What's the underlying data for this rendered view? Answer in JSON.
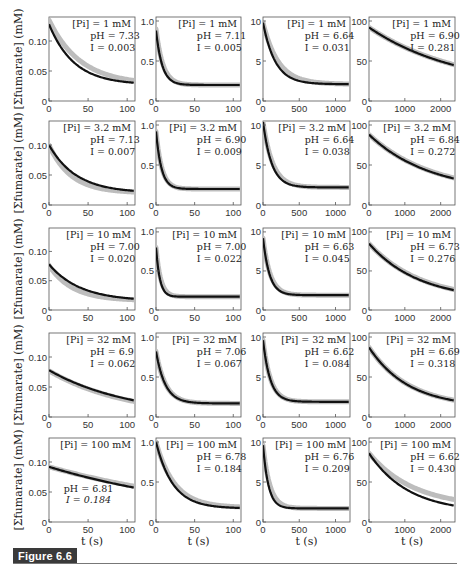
{
  "figure_label": "Figure 6.6",
  "chart_data": {
    "type": "line",
    "title": "",
    "layout": {
      "rows": 5,
      "cols": 4,
      "grid": false,
      "legend": "none"
    },
    "ylabel": "[Σfumarate] (mM)",
    "xlabel": "t (s)",
    "series_styles": {
      "model": {
        "color": "#111111",
        "width": 2.2
      },
      "data": {
        "color": "#bdbdbd",
        "width": 5
      }
    },
    "columns": [
      {
        "xlim": [
          0,
          110
        ],
        "xticks": [
          0,
          50,
          100
        ],
        "ylim": [
          0,
          0.14
        ],
        "yticks": [
          0,
          0.05,
          0.1
        ],
        "ytick_labels": [
          "0",
          "0.05",
          "0.10"
        ]
      },
      {
        "xlim": [
          0,
          110
        ],
        "xticks": [
          0,
          50,
          100
        ],
        "ylim": [
          0,
          1.05
        ],
        "yticks": [
          0,
          0.5,
          1.0
        ],
        "ytick_labels": [
          "0",
          "0.5",
          "1.0"
        ]
      },
      {
        "xlim": [
          0,
          1200
        ],
        "xticks": [
          0,
          500,
          1000
        ],
        "ylim": [
          0,
          10.5
        ],
        "yticks": [
          0,
          5,
          10
        ],
        "ytick_labels": [
          "0",
          "5",
          "10"
        ]
      },
      {
        "xlim": [
          0,
          2400
        ],
        "xticks": [
          0,
          1000,
          2000
        ],
        "ylim": [
          0,
          105
        ],
        "yticks": [
          0,
          50,
          100
        ],
        "ytick_labels": [
          "0",
          "50",
          "100"
        ]
      }
    ],
    "panels": [
      {
        "row": 0,
        "col": 0,
        "pi": "[Pi] = 1 mM",
        "ph": "pH = 7.33",
        "I": "I = 0.003",
        "y0": 0.128,
        "yinf": 0.027,
        "tau": 32,
        "data_y0": 0.135,
        "data_yinf": 0.027,
        "data_tau": 40
      },
      {
        "row": 0,
        "col": 1,
        "pi": "[Pi] = 1 mM",
        "ph": "pH = 7.11",
        "I": "I = 0.005",
        "y0": 0.88,
        "yinf": 0.2,
        "tau": 8,
        "data_y0": 0.9,
        "data_yinf": 0.2,
        "data_tau": 9
      },
      {
        "row": 0,
        "col": 2,
        "pi": "[Pi] = 1 mM",
        "ph": "pH = 6.64",
        "I": "I = 0.031",
        "y0": 9.8,
        "yinf": 2.1,
        "tau": 170,
        "data_y0": 9.8,
        "data_yinf": 2.1,
        "data_tau": 210
      },
      {
        "row": 0,
        "col": 3,
        "pi": "[Pi] = 1 mM",
        "ph": "pH = 6.90",
        "I": "I = 0.281",
        "y0": 92,
        "yinf": 15,
        "tau": 2500,
        "data_y0": 92,
        "data_yinf": 15,
        "data_tau": 2550
      },
      {
        "row": 1,
        "col": 0,
        "pi": "[Pi] = 3.2 mM",
        "ph": "pH = 7.13",
        "I": "I = 0.007",
        "y0": 0.1,
        "yinf": 0.02,
        "tau": 35,
        "data_y0": 0.1,
        "data_yinf": 0.02,
        "data_tau": 28
      },
      {
        "row": 1,
        "col": 1,
        "pi": "[Pi] = 3.2 mM",
        "ph": "pH = 6.90",
        "I": "I = 0.009",
        "y0": 0.92,
        "yinf": 0.2,
        "tau": 7,
        "data_y0": 0.92,
        "data_yinf": 0.2,
        "data_tau": 7.5
      },
      {
        "row": 1,
        "col": 2,
        "pi": "[Pi] = 3.2 mM",
        "ph": "pH = 6.64",
        "I": "I = 0.038",
        "y0": 10.4,
        "yinf": 2.2,
        "tau": 120,
        "data_y0": 10.4,
        "data_yinf": 2.2,
        "data_tau": 135
      },
      {
        "row": 1,
        "col": 3,
        "pi": "[Pi] = 3.2 mM",
        "ph": "pH = 6.84",
        "I": "I = 0.272",
        "y0": 88,
        "yinf": 15,
        "tau": 1700,
        "data_y0": 88,
        "data_yinf": 15,
        "data_tau": 1750
      },
      {
        "row": 2,
        "col": 0,
        "pi": "[Pi] = 10 mM",
        "ph": "pH = 7.00",
        "I": "I = 0.020",
        "y0": 0.078,
        "yinf": 0.015,
        "tau": 40,
        "data_y0": 0.076,
        "data_yinf": 0.016,
        "data_tau": 30
      },
      {
        "row": 2,
        "col": 1,
        "pi": "[Pi] = 10 mM",
        "ph": "pH = 7.00",
        "I": "I = 0.022",
        "y0": 0.8,
        "yinf": 0.17,
        "tau": 5,
        "data_y0": 0.8,
        "data_yinf": 0.17,
        "data_tau": 6
      },
      {
        "row": 2,
        "col": 2,
        "pi": "[Pi] = 10 mM",
        "ph": "pH = 6.63",
        "I": "I = 0.045",
        "y0": 9.2,
        "yinf": 1.9,
        "tau": 90,
        "data_y0": 9.2,
        "data_yinf": 1.9,
        "data_tau": 100
      },
      {
        "row": 2,
        "col": 3,
        "pi": "[Pi] = 10 mM",
        "ph": "pH = 6.73",
        "I": "I = 0.276",
        "y0": 85,
        "yinf": 12,
        "tau": 1400,
        "data_y0": 85,
        "data_yinf": 12,
        "data_tau": 1450
      },
      {
        "row": 3,
        "col": 0,
        "pi": "[Pi] = 32 mM",
        "ph": "pH = 6.9",
        "I": "I = 0.062",
        "y0": 0.078,
        "yinf": 0.0,
        "tau": 105,
        "data_y0": 0.077,
        "data_yinf": 0.0,
        "data_tau": 100
      },
      {
        "row": 3,
        "col": 1,
        "pi": "[Pi] = 32 mM",
        "ph": "pH = 7.06",
        "I": "I = 0.067",
        "y0": 0.82,
        "yinf": 0.17,
        "tau": 12,
        "data_y0": 0.82,
        "data_yinf": 0.17,
        "data_tau": 12.5
      },
      {
        "row": 3,
        "col": 2,
        "pi": "[Pi] = 32 mM",
        "ph": "pH = 6.62",
        "I": "I = 0.084",
        "y0": 9.6,
        "yinf": 1.9,
        "tau": 100,
        "data_y0": 9.6,
        "data_yinf": 1.9,
        "data_tau": 105
      },
      {
        "row": 3,
        "col": 3,
        "pi": "[Pi] = 32 mM",
        "ph": "pH = 6.69",
        "I": "I = 0.318",
        "y0": 87,
        "yinf": 12,
        "tau": 1100,
        "data_y0": 87,
        "data_yinf": 12,
        "data_tau": 1120
      },
      {
        "row": 4,
        "col": 0,
        "pi": "[Pi] = 100 mM",
        "ph": "pH = 6.81",
        "I": "I = 0.184",
        "y0": 0.092,
        "yinf": 0.0,
        "tau": 230,
        "data_y0": 0.092,
        "data_yinf": 0.0,
        "data_tau": 250,
        "annotation_low": true
      },
      {
        "row": 4,
        "col": 1,
        "pi": "[Pi] = 100 mM",
        "ph": "pH = 6.78",
        "I": "I = 0.184",
        "y0": 1.0,
        "yinf": 0.17,
        "tau": 22,
        "data_y0": 1.0,
        "data_yinf": 0.18,
        "data_tau": 24
      },
      {
        "row": 4,
        "col": 2,
        "pi": "[Pi] = 100 mM",
        "ph": "pH = 6.76",
        "I": "I = 0.209",
        "y0": 9.6,
        "yinf": 1.7,
        "tau": 75,
        "data_y0": 9.6,
        "data_yinf": 1.7,
        "data_tau": 95
      },
      {
        "row": 4,
        "col": 3,
        "pi": "[Pi] = 100 mM",
        "ph": "pH = 6.62",
        "I": "I = 0.430",
        "y0": 86,
        "yinf": 12,
        "tau": 1100,
        "data_y0": 86,
        "data_yinf": 18,
        "data_tau": 1250
      }
    ]
  }
}
